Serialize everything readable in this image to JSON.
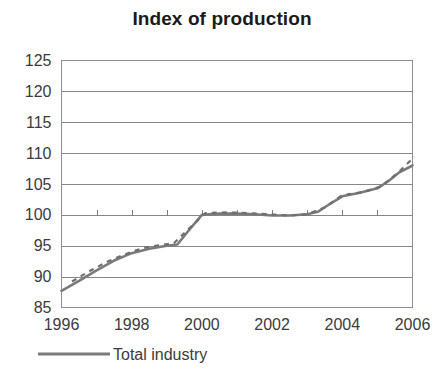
{
  "chart_data": {
    "type": "line",
    "title": "Index of production",
    "xlabel": "",
    "ylabel": "",
    "xlim": [
      1996,
      2006
    ],
    "ylim": [
      85,
      125
    ],
    "grid": true,
    "legend_position": "bottom-left",
    "y_ticks": [
      85,
      90,
      95,
      100,
      105,
      110,
      115,
      120,
      125
    ],
    "y_tick_labels": [
      "85",
      "90",
      "95",
      "100",
      "105",
      "110",
      "115",
      "120",
      "125"
    ],
    "x_ticks": [
      1996,
      1998,
      2000,
      2002,
      2004,
      2006
    ],
    "x_tick_labels": [
      "1996",
      "1998",
      "2000",
      "2002",
      "2004",
      "2006"
    ],
    "x_minor_ticks": [
      1996,
      1997,
      1998,
      1999,
      2000,
      2001,
      2002,
      2003,
      2004,
      2005,
      2006
    ],
    "baseline_value": 100,
    "series": [
      {
        "name": "Total industry",
        "style": "solid",
        "color": "#7a7a7a",
        "x": [
          1996.0,
          1996.5,
          1997.0,
          1997.5,
          1998.0,
          1998.5,
          1999.0,
          1999.3,
          1999.6,
          2000.0,
          2000.5,
          2001.0,
          2001.5,
          2002.0,
          2002.5,
          2003.0,
          2003.3,
          2003.6,
          2004.0,
          2004.5,
          2005.0,
          2005.3,
          2005.6,
          2006.0
        ],
        "values": [
          87.7,
          89.3,
          91.0,
          92.6,
          93.8,
          94.5,
          95.0,
          95.2,
          97.3,
          100.0,
          100.2,
          100.2,
          100.1,
          99.9,
          99.9,
          100.1,
          100.5,
          101.6,
          103.0,
          103.6,
          104.3,
          105.4,
          106.8,
          108.0
        ]
      },
      {
        "name": "Trend",
        "style": "dashed",
        "color": "#6f6f6f",
        "x": [
          1996.3,
          1996.8,
          1997.3,
          1997.8,
          1998.3,
          1998.8,
          1999.2,
          1999.6,
          2000.1,
          2000.7,
          2001.3,
          2001.9,
          2002.5,
          2003.0,
          2003.5,
          2004.0,
          2004.6,
          2005.1,
          2005.6,
          2006.05
        ],
        "values": [
          89.2,
          90.9,
          92.4,
          93.6,
          94.6,
          95.1,
          95.4,
          97.6,
          100.3,
          100.4,
          100.3,
          100.1,
          99.9,
          100.1,
          101.2,
          103.2,
          103.7,
          104.6,
          106.9,
          109.4
        ]
      }
    ],
    "legend": [
      {
        "label": "Total industry",
        "color": "#7a7a7a",
        "style": "solid"
      }
    ]
  },
  "colors": {
    "line": "#7a7a7a",
    "grid": "#868686",
    "axis": "#8e8e8e",
    "text": "#3b3b3b",
    "title": "#1a1a1a",
    "background": "#ffffff"
  }
}
